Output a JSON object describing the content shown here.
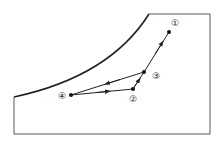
{
  "diagram": {
    "type": "state-path-in-bounded-region",
    "colors": {
      "line": "#222222",
      "background": "#ffffff"
    },
    "boundary": {
      "description": "region bounded by a concave curve on upper-left, top edge, right edge, bottom edge and left edge"
    },
    "points": [
      {
        "id": "p1",
        "label": "①",
        "x": 169,
        "y": 32,
        "lx": 175,
        "ly": 23
      },
      {
        "id": "p3",
        "label": "③",
        "x": 144,
        "y": 72,
        "lx": 156,
        "ly": 76
      },
      {
        "id": "p2",
        "label": "②",
        "x": 133,
        "y": 89,
        "lx": 133,
        "ly": 99
      },
      {
        "id": "p4",
        "label": "④",
        "x": 71,
        "y": 95,
        "lx": 62,
        "ly": 96
      }
    ],
    "path": [
      {
        "from": "p1",
        "to": "p3",
        "direction": "toward ①"
      },
      {
        "from": "p2",
        "to": "p3",
        "direction": "toward ③"
      },
      {
        "from": "p3",
        "to": "p4",
        "direction": "toward ④"
      },
      {
        "from": "p4",
        "to": "p2",
        "direction": "toward ②"
      }
    ]
  }
}
